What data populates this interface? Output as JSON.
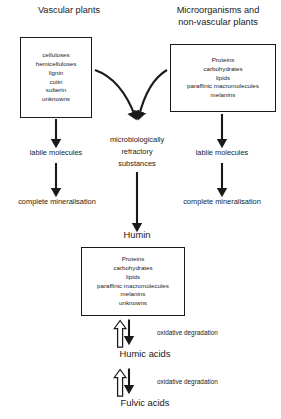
{
  "diagram": {
    "line_color": "#1a1a1a",
    "background_color": "#ffffff",
    "headings": {
      "left": "Vascular plants",
      "right_line1": "Microorganisms and",
      "right_line2": "non-vascular plants"
    },
    "boxes": {
      "vascular_plants": {
        "items": [
          "celluloses",
          "hemicelluloses",
          "lignin",
          "cutin",
          "suberin",
          "unknowns"
        ]
      },
      "microorganisms": {
        "items": [
          "Proteins",
          "carbohydrates",
          "lipids",
          "paraffinic macromolecules",
          "melanins"
        ]
      },
      "humin": {
        "items": [
          "Proteins",
          "carbohydrates",
          "lipids",
          "paraffinic macromolecules",
          "melanins",
          "unknowns"
        ]
      }
    },
    "labels": {
      "left_labile": "labile molecules",
      "left_mineralisation": "complete mineralisation",
      "right_labile": "labile molecules",
      "right_mineralisation": "complete mineralisation",
      "refractory_line1": "microbiologically",
      "refractory_line2": "refractory",
      "refractory_line3": "substances",
      "humin": "Humin",
      "humic_acids": "Humic acids",
      "fulvic_acids": "Fulvic acids",
      "oxidative_degradation_upper": "oxidative degradation",
      "oxidative_degradation_lower": "oxidative degradation"
    }
  }
}
